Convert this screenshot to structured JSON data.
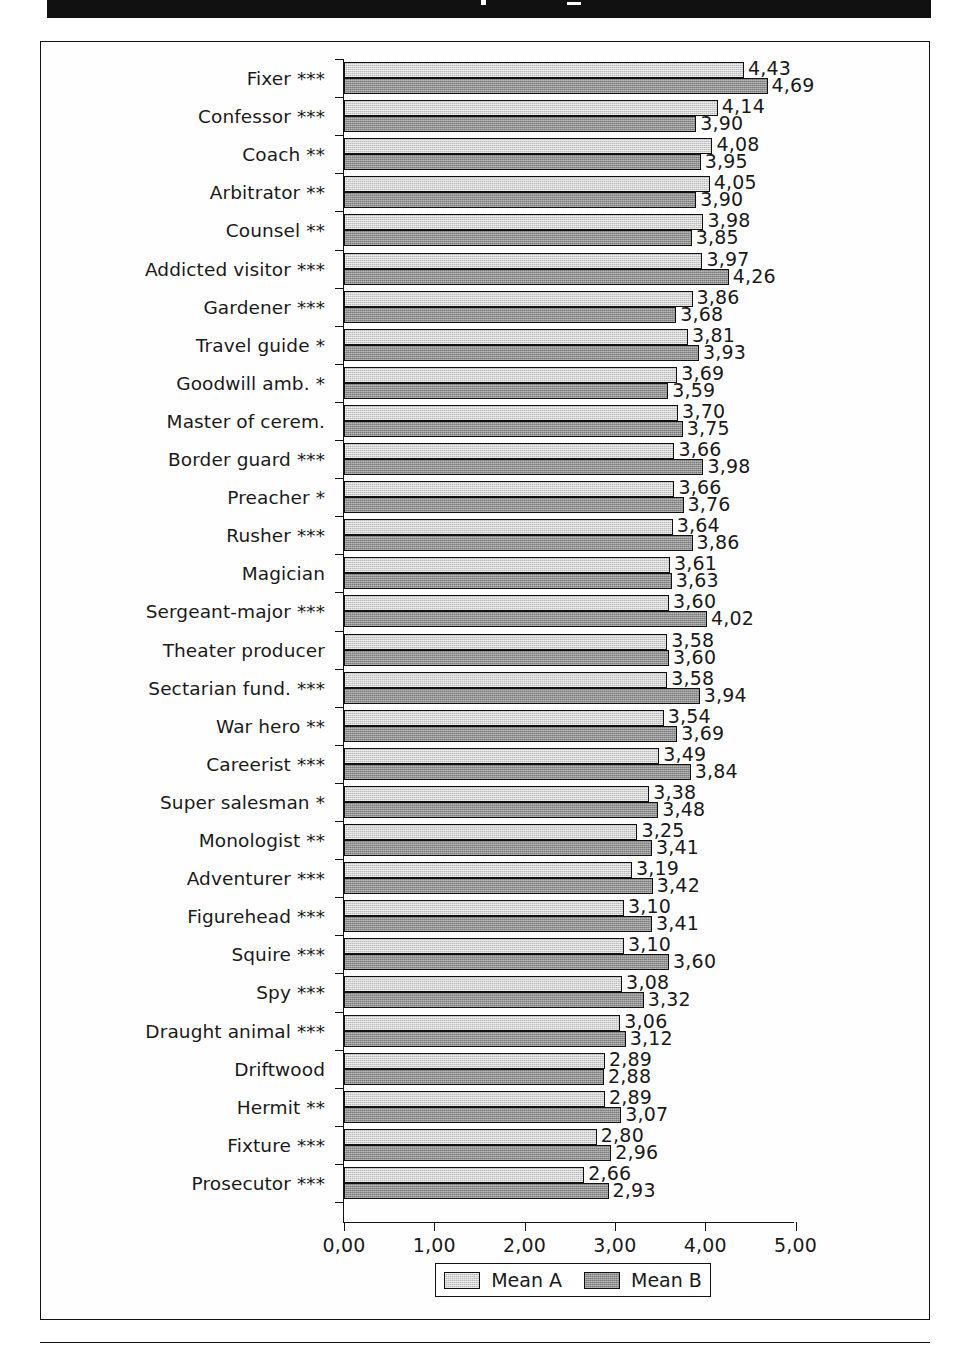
{
  "figure": {
    "background_color": "#ffffff",
    "frame_color": "#111111"
  },
  "chart_data": {
    "type": "bar",
    "orientation": "horizontal",
    "title": "",
    "subtitle": "",
    "xlabel": "",
    "ylabel": "",
    "xlim": [
      0,
      5
    ],
    "xticks": [
      "0,00",
      "1,00",
      "2,00",
      "3,00",
      "4,00",
      "5,00"
    ],
    "xtick_values": [
      0,
      1,
      2,
      3,
      4,
      5
    ],
    "grid": false,
    "legend_position": "bottom-center",
    "decimal_separator": ",",
    "categories": [
      "Fixer ***",
      "Confessor ***",
      "Coach **",
      "Arbitrator **",
      "Counsel **",
      "Addicted visitor ***",
      "Gardener ***",
      "Travel guide *",
      "Goodwill amb. *",
      "Master of cerem.",
      "Border guard ***",
      "Preacher *",
      "Rusher ***",
      "Magician",
      "Sergeant-major ***",
      "Theater producer",
      "Sectarian fund. ***",
      "War hero **",
      "Careerist ***",
      "Super salesman *",
      "Monologist **",
      "Adventurer ***",
      "Figurehead ***",
      "Squire ***",
      "Spy ***",
      "Draught animal ***",
      "Driftwood",
      "Hermit **",
      "Fixture ***",
      "Prosecutor ***"
    ],
    "series": [
      {
        "name": "Mean A",
        "color": "#bdbdbd",
        "values": [
          4.43,
          4.14,
          4.08,
          4.05,
          3.98,
          3.97,
          3.86,
          3.81,
          3.69,
          3.7,
          3.66,
          3.66,
          3.64,
          3.61,
          3.6,
          3.58,
          3.58,
          3.54,
          3.49,
          3.38,
          3.25,
          3.19,
          3.1,
          3.1,
          3.08,
          3.06,
          2.89,
          2.89,
          2.8,
          2.66
        ],
        "labels": [
          "4,43",
          "4,14",
          "4,08",
          "4,05",
          "3,98",
          "3,97",
          "3,86",
          "3,81",
          "3,69",
          "3,70",
          "3,66",
          "3,66",
          "3,64",
          "3,61",
          "3,60",
          "3,58",
          "3,58",
          "3,54",
          "3,49",
          "3,38",
          "3,25",
          "3,19",
          "3,10",
          "3,10",
          "3,08",
          "3,06",
          "2,89",
          "2,89",
          "2,80",
          "2,66"
        ]
      },
      {
        "name": "Mean B",
        "color": "#7d7d7d",
        "values": [
          4.69,
          3.9,
          3.95,
          3.9,
          3.85,
          4.26,
          3.68,
          3.93,
          3.59,
          3.75,
          3.98,
          3.76,
          3.86,
          3.63,
          4.02,
          3.6,
          3.94,
          3.69,
          3.84,
          3.48,
          3.41,
          3.42,
          3.41,
          3.6,
          3.32,
          3.12,
          2.88,
          3.07,
          2.96,
          2.93
        ],
        "labels": [
          "4,69",
          "3,90",
          "3,95",
          "3,90",
          "3,85",
          "4,26",
          "3,68",
          "3,93",
          "3,59",
          "3,75",
          "3,98",
          "3,76",
          "3,86",
          "3,63",
          "4,02",
          "3,60",
          "3,94",
          "3,69",
          "3,84",
          "3,48",
          "3,41",
          "3,42",
          "3,41",
          "3,60",
          "3,32",
          "3,12",
          "2,88",
          "3,07",
          "2,96",
          "2,93"
        ]
      }
    ]
  },
  "legend": {
    "entries": [
      {
        "label": "Mean A",
        "swatch": "light-gray-swatch"
      },
      {
        "label": "Mean B",
        "swatch": "dark-gray-swatch"
      }
    ]
  }
}
